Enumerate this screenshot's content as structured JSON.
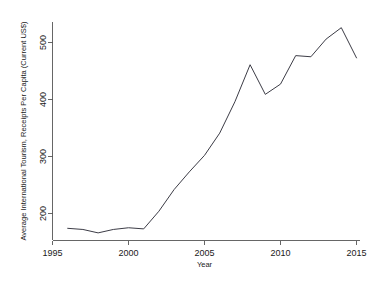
{
  "chart_data": {
    "type": "line",
    "title": "",
    "xlabel": "Year",
    "ylabel": "Average International Tourism, Receipts Per Capita (Current US$)",
    "xlim": [
      1995,
      2015
    ],
    "ylim": [
      160,
      540
    ],
    "xticks": [
      1995,
      2000,
      2005,
      2010,
      2015
    ],
    "xtick_labels": [
      "1995",
      "2000",
      "2005",
      "2010",
      "2015"
    ],
    "yticks": [
      200,
      300,
      400,
      500
    ],
    "ytick_labels": [
      "200",
      "300",
      "400",
      "500"
    ],
    "grid": false,
    "legend": null,
    "line_color": "#3c3c46",
    "x": [
      1996,
      1997,
      1998,
      1999,
      2000,
      2001,
      2002,
      2003,
      2004,
      2005,
      2006,
      2007,
      2008,
      2009,
      2010,
      2011,
      2012,
      2013,
      2014,
      2015
    ],
    "values": [
      174,
      172,
      166,
      172,
      175,
      173,
      204,
      242,
      273,
      302,
      341,
      396,
      461,
      409,
      427,
      477,
      475,
      506,
      526,
      473
    ],
    "series": [
      {
        "name": "Average International Tourism, Receipts Per Capita (Current US$)",
        "values": [
          174,
          172,
          166,
          172,
          175,
          173,
          204,
          242,
          273,
          302,
          341,
          396,
          461,
          409,
          427,
          477,
          475,
          506,
          526,
          473
        ]
      }
    ],
    "annotations": []
  },
  "axes": {
    "x_axis_title": "Year",
    "y_axis_title": "Average International Tourism, Receipts Per Capita (Current US$)"
  }
}
